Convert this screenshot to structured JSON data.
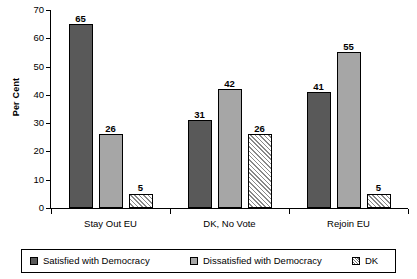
{
  "chart_data": {
    "type": "bar",
    "title": "",
    "subtitle": "",
    "xlabel": "",
    "ylabel": "Per Cent",
    "ylim": [
      0,
      70
    ],
    "yticks": [
      0,
      10,
      20,
      30,
      40,
      50,
      60,
      70
    ],
    "ytick_labels": [
      "0",
      "10",
      "20",
      "30",
      "40",
      "50",
      "60",
      "70"
    ],
    "grid": false,
    "legend_position": "bottom",
    "categories": [
      "Stay Out EU",
      "DK, No Vote",
      "Rejoin EU"
    ],
    "series": [
      {
        "name": "Satisfied with Democracy",
        "color": "#595959",
        "fill": "solid",
        "values": [
          65,
          31,
          41
        ],
        "labels": [
          "65",
          "31",
          "41"
        ]
      },
      {
        "name": "Dissatisfied with Democracy",
        "color": "#a6a6a6",
        "fill": "solid",
        "values": [
          26,
          42,
          55
        ],
        "labels": [
          "26",
          "42",
          "55"
        ]
      },
      {
        "name": "DK",
        "color": "#ffffff",
        "fill": "diagonal-hatch",
        "values": [
          5,
          26,
          5
        ],
        "labels": [
          "5",
          "26",
          "5"
        ]
      }
    ]
  },
  "axis": {
    "y_title": "Per Cent",
    "y_tick_labels": [
      "70",
      "60",
      "50",
      "40",
      "30",
      "20",
      "10",
      "0"
    ]
  },
  "legend": {
    "items": [
      {
        "label": "Satisfied with Democracy",
        "swatch": "swatch-dark-gray"
      },
      {
        "label": "Dissatisfied with Democracy",
        "swatch": "swatch-light-gray"
      },
      {
        "label": "DK",
        "swatch": "swatch-hatched"
      }
    ]
  }
}
